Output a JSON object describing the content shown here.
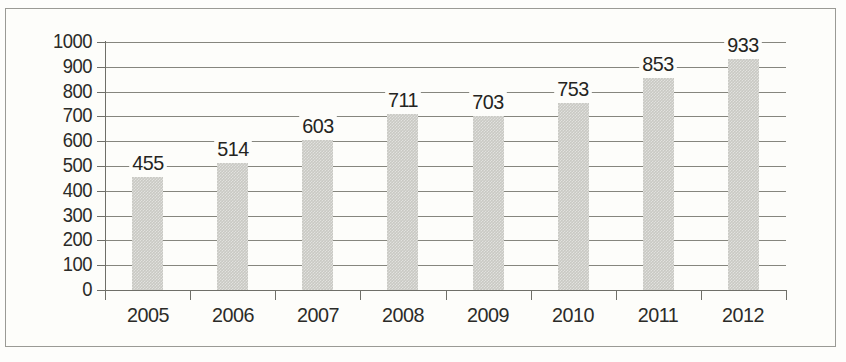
{
  "chart_data": {
    "type": "bar",
    "title": "",
    "subtitle": "",
    "xlabel": "",
    "ylabel": "",
    "categories": [
      "2005",
      "2006",
      "2007",
      "2008",
      "2009",
      "2010",
      "2011",
      "2012"
    ],
    "values": [
      455,
      514,
      603,
      711,
      703,
      753,
      853,
      933
    ],
    "data_labels": [
      "455",
      "514",
      "603",
      "711",
      "703",
      "753",
      "853",
      "933"
    ],
    "ylim": [
      0,
      1000
    ],
    "ytick_values": [
      0,
      100,
      200,
      300,
      400,
      500,
      600,
      700,
      800,
      900,
      1000
    ],
    "ytick_labels": [
      "0",
      "100",
      "200",
      "300",
      "400",
      "500",
      "600",
      "700",
      "800",
      "900",
      "1000"
    ],
    "grid": true,
    "grid_orientation": "horizontal",
    "legend": null,
    "legend_position": "none",
    "series": [
      {
        "name": "series-1",
        "values": [
          455,
          514,
          603,
          711,
          703,
          753,
          853,
          933
        ],
        "color": "#c9c9c3"
      }
    ],
    "colors": {
      "bar_fill": "#c9c9c3",
      "gridline": "#86867e",
      "axis": "#6f6f68",
      "text": "#2b2b28",
      "background": "#fdfdfa",
      "frame_border": "#9a9a95"
    }
  }
}
